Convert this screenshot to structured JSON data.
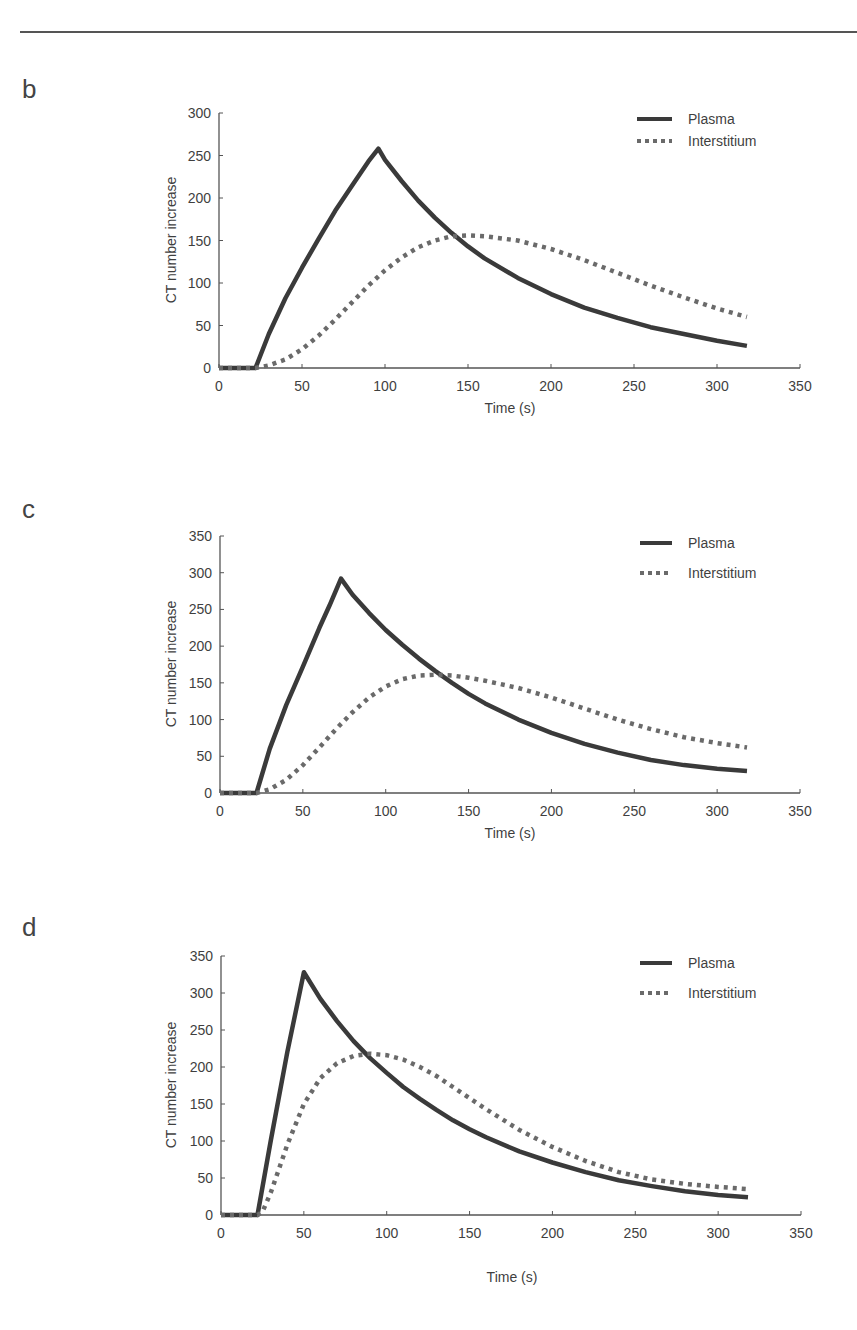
{
  "page": {
    "top_rule": true
  },
  "chart_data": [
    {
      "panel": "b",
      "type": "line",
      "title": "",
      "xlabel": "Time (s)",
      "ylabel": "CT number increase",
      "xlim": [
        0,
        350
      ],
      "ylim": [
        0,
        300
      ],
      "xticks": [
        0,
        50,
        100,
        150,
        200,
        250,
        300,
        350
      ],
      "yticks": [
        0,
        50,
        100,
        150,
        200,
        250,
        300
      ],
      "grid": false,
      "legend_position": "upper right",
      "series": [
        {
          "name": "Plasma",
          "style": "solid",
          "x": [
            0,
            22,
            30,
            40,
            50,
            60,
            70,
            80,
            90,
            96,
            100,
            110,
            120,
            130,
            140,
            150,
            160,
            180,
            200,
            220,
            240,
            260,
            280,
            300,
            318
          ],
          "y": [
            0,
            0,
            40,
            82,
            118,
            152,
            185,
            214,
            243,
            258,
            245,
            220,
            197,
            177,
            159,
            143,
            129,
            106,
            87,
            71,
            59,
            48,
            40,
            32,
            26
          ]
        },
        {
          "name": "Interstitium",
          "style": "dotted",
          "x": [
            0,
            22,
            30,
            40,
            50,
            60,
            70,
            80,
            90,
            100,
            110,
            120,
            130,
            140,
            150,
            160,
            180,
            200,
            220,
            240,
            260,
            280,
            300,
            318
          ],
          "y": [
            0,
            0,
            3,
            10,
            22,
            38,
            57,
            77,
            97,
            115,
            130,
            142,
            150,
            155,
            156,
            155,
            150,
            140,
            127,
            112,
            97,
            83,
            70,
            60
          ]
        }
      ]
    },
    {
      "panel": "c",
      "type": "line",
      "title": "",
      "xlabel": "Time (s)",
      "ylabel": "CT number increase",
      "xlim": [
        0,
        350
      ],
      "ylim": [
        0,
        350
      ],
      "xticks": [
        0,
        50,
        100,
        150,
        200,
        250,
        300,
        350
      ],
      "yticks": [
        0,
        50,
        100,
        150,
        200,
        250,
        300,
        350
      ],
      "grid": false,
      "legend_position": "upper right",
      "series": [
        {
          "name": "Plasma",
          "style": "solid",
          "x": [
            0,
            22,
            30,
            40,
            50,
            60,
            66,
            73,
            80,
            90,
            100,
            110,
            120,
            130,
            140,
            150,
            160,
            180,
            200,
            220,
            240,
            260,
            280,
            300,
            318
          ],
          "y": [
            0,
            0,
            60,
            120,
            172,
            225,
            255,
            292,
            270,
            245,
            222,
            202,
            183,
            166,
            150,
            135,
            122,
            100,
            82,
            67,
            55,
            45,
            38,
            33,
            30
          ]
        },
        {
          "name": "Interstitium",
          "style": "dotted",
          "x": [
            0,
            22,
            30,
            40,
            50,
            60,
            70,
            80,
            90,
            100,
            110,
            120,
            130,
            140,
            150,
            160,
            180,
            200,
            220,
            240,
            260,
            280,
            300,
            318
          ],
          "y": [
            0,
            0,
            5,
            18,
            38,
            62,
            87,
            110,
            130,
            145,
            155,
            160,
            161,
            160,
            157,
            153,
            143,
            130,
            115,
            100,
            87,
            76,
            68,
            62
          ]
        }
      ]
    },
    {
      "panel": "d",
      "type": "line",
      "title": "",
      "xlabel": "Time (s)",
      "ylabel": "CT number increase",
      "xlim": [
        0,
        350
      ],
      "ylim": [
        0,
        350
      ],
      "xticks": [
        0,
        50,
        100,
        150,
        200,
        250,
        300,
        350
      ],
      "yticks": [
        0,
        50,
        100,
        150,
        200,
        250,
        300,
        350
      ],
      "grid": false,
      "legend_position": "upper right",
      "series": [
        {
          "name": "Plasma",
          "style": "solid",
          "x": [
            0,
            22,
            30,
            40,
            50,
            60,
            70,
            80,
            90,
            100,
            110,
            120,
            130,
            140,
            150,
            160,
            180,
            200,
            220,
            240,
            260,
            280,
            300,
            318
          ],
          "y": [
            0,
            0,
            100,
            220,
            328,
            292,
            262,
            235,
            212,
            192,
            173,
            157,
            142,
            128,
            116,
            105,
            86,
            71,
            58,
            47,
            39,
            32,
            27,
            24
          ]
        },
        {
          "name": "Interstitium",
          "style": "dotted",
          "x": [
            0,
            22,
            25,
            30,
            40,
            50,
            60,
            70,
            80,
            90,
            100,
            110,
            120,
            130,
            140,
            150,
            160,
            180,
            200,
            220,
            240,
            260,
            280,
            300,
            318
          ],
          "y": [
            0,
            0,
            4,
            30,
            95,
            150,
            185,
            205,
            215,
            218,
            216,
            210,
            200,
            188,
            173,
            158,
            143,
            115,
            92,
            73,
            58,
            48,
            42,
            38,
            35
          ]
        }
      ]
    }
  ],
  "panels": [
    {
      "label": "b",
      "xlabel": "Time (s)",
      "ylabel": "CT number increase",
      "legend": [
        "Plasma",
        "Interstitium"
      ]
    },
    {
      "label": "c",
      "xlabel": "Time (s)",
      "ylabel": "CT number increase",
      "legend": [
        "Plasma",
        "Interstitium"
      ]
    },
    {
      "label": "d",
      "xlabel": "Time (s)",
      "ylabel": "CT number increase",
      "legend": [
        "Plasma",
        "Interstitium"
      ]
    }
  ],
  "colors": {
    "plasma": "#3a3a3a",
    "interstitium": "#6a6a6a",
    "axis": "#555555",
    "text": "#3f3f3f"
  }
}
